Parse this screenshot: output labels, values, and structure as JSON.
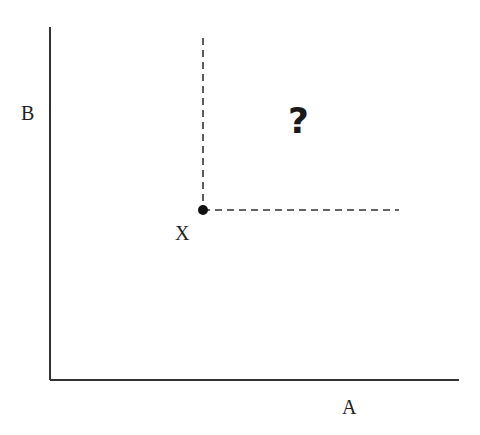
{
  "diagram": {
    "type": "quadrant-dominance",
    "axes": {
      "x_label": "A",
      "y_label": "B"
    },
    "point": {
      "label": "X"
    },
    "region_marker": "?",
    "colors": {
      "axis": "#333333",
      "dashed": "#333333",
      "point": "#111111",
      "text": "#222222"
    }
  }
}
